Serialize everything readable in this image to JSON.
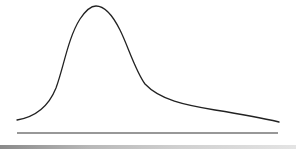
{
  "diagram": {
    "type": "skewed-distribution-curve",
    "colors": {
      "background": "#ffffff",
      "curve": "#222222",
      "baseline": "#333333",
      "bottom_band": "#9a9a9a"
    },
    "curve": {
      "start": [
        17,
        120
      ],
      "peak": [
        96,
        6
      ],
      "end": [
        279,
        122
      ],
      "skew": "right"
    },
    "baseline": {
      "x1": 17,
      "x2": 278,
      "y": 133
    }
  }
}
